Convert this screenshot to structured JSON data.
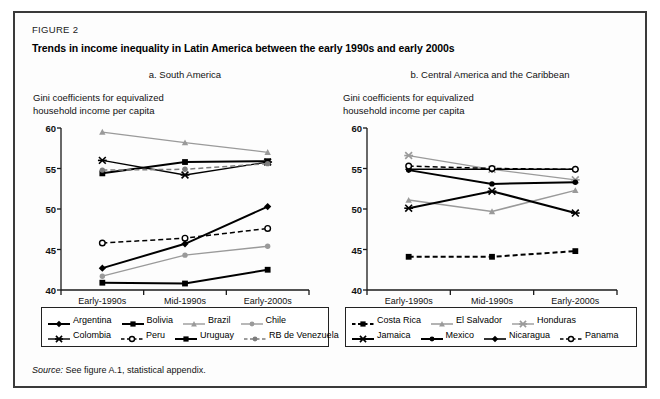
{
  "figure": {
    "label": "FIGURE 2",
    "title": "Trends in income inequality in Latin America between the early 1990s and early 2000s",
    "source_prefix": "Source:",
    "source_text": "See figure A.1, statistical appendix."
  },
  "chart_data": [
    {
      "type": "line",
      "panel": "a",
      "title": "a. South America",
      "ylabel": "Gini coefficients for equivalized\nhousehold income per capita",
      "ylabel_line1": "Gini coefficients for equivalized",
      "ylabel_line2": "household income per capita",
      "xlabel": "",
      "categories": [
        "Early-1990s",
        "Mid-1990s",
        "Early-2000s"
      ],
      "ylim": [
        40,
        60
      ],
      "yticks": [
        40,
        45,
        50,
        55,
        60
      ],
      "grid": false,
      "legend_position": "below",
      "series": [
        {
          "name": "Argentina",
          "values": [
            42.7,
            45.7,
            50.3
          ],
          "color": "#000000",
          "marker": "diamond",
          "dash": "solid",
          "width": 2.0
        },
        {
          "name": "Bolivia",
          "values": [
            40.9,
            40.8,
            42.5
          ],
          "color": "#000000",
          "marker": "square",
          "dash": "solid",
          "width": 2.0
        },
        {
          "name": "Brazil",
          "values": [
            59.5,
            58.2,
            57.0
          ],
          "color": "#9a9a9a",
          "marker": "triangle",
          "dash": "solid",
          "width": 1.3
        },
        {
          "name": "Chile",
          "values": [
            41.7,
            44.3,
            45.4
          ],
          "color": "#9a9a9a",
          "marker": "circle",
          "dash": "solid",
          "width": 1.3
        },
        {
          "name": "Colombia",
          "values": [
            56.0,
            54.2,
            55.8
          ],
          "color": "#000000",
          "marker": "x",
          "dash": "solid",
          "width": 1.3
        },
        {
          "name": "Peru",
          "values": [
            45.8,
            46.4,
            47.6
          ],
          "color": "#000000",
          "marker": "open-circle",
          "dash": "dashed",
          "width": 1.5
        },
        {
          "name": "Uruguay",
          "values": [
            54.4,
            55.8,
            55.9
          ],
          "color": "#000000",
          "marker": "square",
          "dash": "solid",
          "width": 2.0
        },
        {
          "name": "RB de Venezuela",
          "values": [
            54.8,
            54.9,
            55.6
          ],
          "color": "#7d7d7d",
          "marker": "circle",
          "dash": "dashed",
          "width": 1.5
        }
      ]
    },
    {
      "type": "line",
      "panel": "b",
      "title": "b. Central America and the Caribbean",
      "ylabel_line1": "Gini coefficients for equivalized",
      "ylabel_line2": "household income per capita",
      "xlabel": "",
      "categories": [
        "Early-1990s",
        "Mid-1990s",
        "Early-2000s"
      ],
      "ylim": [
        40,
        60
      ],
      "yticks": [
        40,
        45,
        50,
        55,
        60
      ],
      "grid": false,
      "legend_position": "below",
      "series": [
        {
          "name": "Costa Rica",
          "values": [
            44.1,
            44.1,
            44.8
          ],
          "color": "#000000",
          "marker": "square",
          "dash": "dashed",
          "width": 2.0
        },
        {
          "name": "El Salvador",
          "values": [
            51.1,
            49.7,
            52.3
          ],
          "color": "#9a9a9a",
          "marker": "triangle",
          "dash": "solid",
          "width": 1.5
        },
        {
          "name": "Honduras",
          "values": [
            56.6,
            54.9,
            53.6
          ],
          "color": "#9a9a9a",
          "marker": "x",
          "dash": "solid",
          "width": 1.3
        },
        {
          "name": "Jamaica",
          "values": [
            50.1,
            52.2,
            49.5
          ],
          "color": "#000000",
          "marker": "x",
          "dash": "solid",
          "width": 2.0
        },
        {
          "name": "Mexico",
          "values": [
            54.8,
            53.1,
            53.3
          ],
          "color": "#000000",
          "marker": "circle",
          "dash": "solid",
          "width": 2.0
        },
        {
          "name": "Nicaragua",
          "values": [
            54.9,
            54.9,
            54.9
          ],
          "color": "#000000",
          "marker": "diamond",
          "dash": "solid",
          "width": 1.6
        },
        {
          "name": "Panama",
          "values": [
            55.3,
            55.0,
            54.9
          ],
          "color": "#000000",
          "marker": "open-circle",
          "dash": "dashed",
          "width": 1.5
        }
      ]
    }
  ],
  "legend_a": {
    "rows": [
      [
        "Argentina",
        "Bolivia",
        "Brazil",
        "Chile"
      ],
      [
        "Colombia",
        "Peru",
        "Uruguay",
        "RB de Venezuela"
      ]
    ]
  },
  "legend_b": {
    "rows": [
      [
        "Costa Rica",
        "El Salvador",
        "Honduras"
      ],
      [
        "Jamaica",
        "Mexico",
        "Nicaragua",
        "Panama"
      ]
    ]
  },
  "colors": {
    "frame": "#3a3a3a",
    "axis": "#1a1a1a",
    "black_series": "#000000",
    "gray_series": "#9a9a9a"
  }
}
